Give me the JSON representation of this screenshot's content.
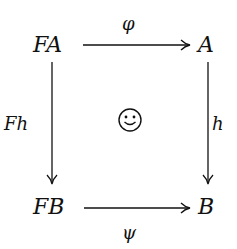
{
  "diagram": {
    "type": "commutative-square",
    "nodes": {
      "top_left": "FA",
      "top_right": "A",
      "bottom_left": "FB",
      "bottom_right": "B"
    },
    "arrows": {
      "top": {
        "from": "FA",
        "to": "A",
        "label": "φ"
      },
      "bottom": {
        "from": "FB",
        "to": "B",
        "label": "ψ"
      },
      "left": {
        "from": "FA",
        "to": "FB",
        "label": "Fh"
      },
      "right": {
        "from": "A",
        "to": "B",
        "label": "h"
      }
    },
    "center_symbol": "smiley-face"
  }
}
